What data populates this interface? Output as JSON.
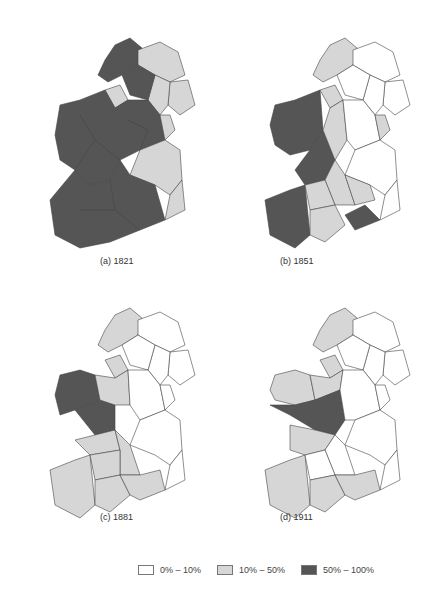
{
  "colors": {
    "low": "#ffffff",
    "mid": "#d6d6d6",
    "high": "#555555",
    "border": "#444444"
  },
  "panels": [
    {
      "label": "(a) 1821"
    },
    {
      "label": "(b) 1851"
    },
    {
      "label": "(c) 1881"
    },
    {
      "label": "(d) 1911"
    }
  ],
  "legend": {
    "items": [
      {
        "label": "0% – 10%",
        "color": "#ffffff"
      },
      {
        "label": "10% – 50%",
        "color": "#d6d6d6"
      },
      {
        "label": "50% – 100%",
        "color": "#555555"
      }
    ]
  }
}
